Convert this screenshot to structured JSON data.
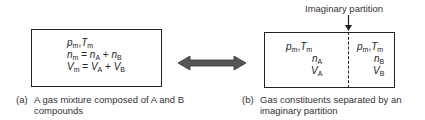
{
  "diagram": {
    "left_box": {
      "lines": [
        {
          "parts": [
            "p",
            "m",
            ", ",
            "T",
            "m"
          ]
        },
        {
          "text": "n_m = n_A + n_B"
        },
        {
          "text": "V_m = V_A + V_B"
        }
      ],
      "sub_m": "m",
      "sub_A": "A",
      "sub_B": "B",
      "var_p": "p",
      "var_T": "T",
      "var_n": "n",
      "var_V": "V",
      "comma": ",",
      "eq": " = ",
      "plus": " + "
    },
    "arrow": {
      "type": "double-headed",
      "color": "#555555"
    },
    "right_box": {
      "partition_label": "Imaginary partition",
      "left_half": {
        "state": "p_m, T_m",
        "moles": "n_A",
        "volume": "V_A"
      },
      "right_half": {
        "state": "p_m, T_m",
        "moles": "n_B",
        "volume": "V_B"
      }
    },
    "captions": {
      "a_tag": "(a)",
      "a_line1": "A gas mixture composed of A and B",
      "a_line2": "compounds",
      "b_tag": "(b)",
      "b_line1": "Gas constituents separated by an",
      "b_line2": "imaginary partition"
    }
  }
}
